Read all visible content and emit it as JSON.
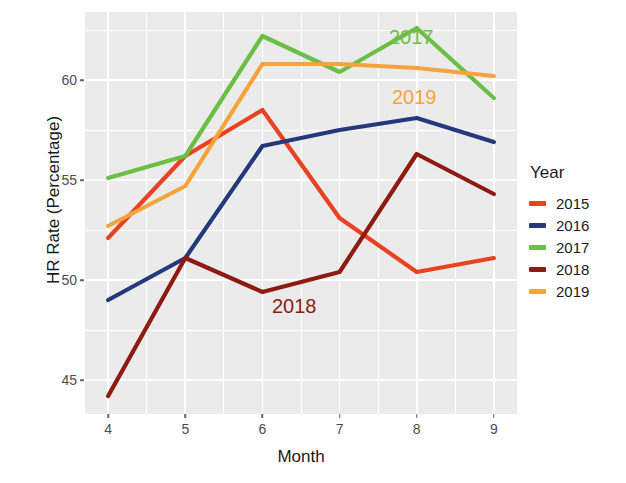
{
  "chart_data": {
    "type": "line",
    "title": "",
    "xlabel": "Month",
    "ylabel": "HR Rate (Percentage)",
    "x": [
      4,
      5,
      6,
      7,
      8,
      9
    ],
    "xlim": [
      3.7,
      9.3
    ],
    "ylim": [
      43.3,
      63.4
    ],
    "xticks": [
      4,
      5,
      6,
      7,
      8,
      9
    ],
    "xtick_labels": [
      "4",
      "5",
      "6",
      "7",
      "8",
      "9"
    ],
    "yticks": [
      45,
      50,
      55,
      60
    ],
    "ytick_labels": [
      "45",
      "50",
      "55",
      "60"
    ],
    "grid": true,
    "legend_position": "right",
    "legend_title": "Year",
    "series": [
      {
        "name": "2015",
        "color": "#ea4122",
        "values": [
          52.1,
          56.2,
          58.5,
          53.1,
          50.4,
          51.1
        ]
      },
      {
        "name": "2016",
        "color": "#24397a",
        "values": [
          49.0,
          51.1,
          56.7,
          57.5,
          58.1,
          56.9
        ]
      },
      {
        "name": "2017",
        "color": "#6bbf45",
        "values": [
          55.1,
          56.2,
          62.2,
          60.4,
          62.6,
          59.1
        ]
      },
      {
        "name": "2018",
        "color": "#8e1b12",
        "values": [
          44.2,
          51.1,
          49.4,
          50.4,
          56.3,
          54.3
        ]
      },
      {
        "name": "2019",
        "color": "#f5a43c",
        "values": [
          52.7,
          54.7,
          60.8,
          60.8,
          60.6,
          60.2
        ]
      }
    ],
    "annotations": [
      {
        "text": "2017",
        "series": "2017",
        "color": "#6bbf45",
        "x_px": 389,
        "y_px": 26
      },
      {
        "text": "2019",
        "series": "2019",
        "color": "#f5a43c",
        "x_px": 392,
        "y_px": 86
      },
      {
        "text": "2018",
        "series": "2018",
        "color": "#8e1b12",
        "x_px": 272,
        "y_px": 295
      }
    ]
  },
  "legend": {
    "title": "Year",
    "items": [
      {
        "label": "2015",
        "color": "#ea4122"
      },
      {
        "label": "2016",
        "color": "#24397a"
      },
      {
        "label": "2017",
        "color": "#6bbf45"
      },
      {
        "label": "2018",
        "color": "#8e1b12"
      },
      {
        "label": "2019",
        "color": "#f5a43c"
      }
    ]
  },
  "axes": {
    "x_title": "Month",
    "y_title": "HR Rate (Percentage)"
  }
}
